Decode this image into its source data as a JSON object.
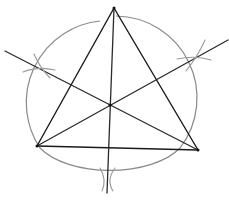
{
  "diagram": {
    "type": "geometric-construction",
    "colors": {
      "lines": "#1a1a1a",
      "circle": "#8a8a8a",
      "construction_arcs": "#9a9a9a",
      "background": "#ffffff"
    },
    "triangle": {
      "vertices": [
        {
          "name": "top",
          "x": 114,
          "y": 8
        },
        {
          "name": "bottom-left",
          "x": 37,
          "y": 146
        },
        {
          "name": "bottom-right",
          "x": 198,
          "y": 150
        }
      ]
    },
    "circumcenter": {
      "x": 110,
      "y": 105
    },
    "circumcircle": {
      "cx": 110,
      "cy": 96,
      "r": 82
    },
    "bisectors": [
      {
        "name": "bisector-left-to-right",
        "x1": 5,
        "y1": 51,
        "x2": 198,
        "y2": 150
      },
      {
        "name": "bisector-right-upper",
        "x1": 37,
        "y1": 146,
        "x2": 228,
        "y2": 40
      },
      {
        "name": "bisector-vertical",
        "x1": 114,
        "y1": 8,
        "x2": 107,
        "y2": 193
      }
    ],
    "construction_marks": [
      {
        "name": "left-mark",
        "x": 40,
        "y": 68
      },
      {
        "name": "right-mark",
        "x": 195,
        "y": 57
      },
      {
        "name": "bottom-mark",
        "x": 107,
        "y": 180
      }
    ]
  }
}
